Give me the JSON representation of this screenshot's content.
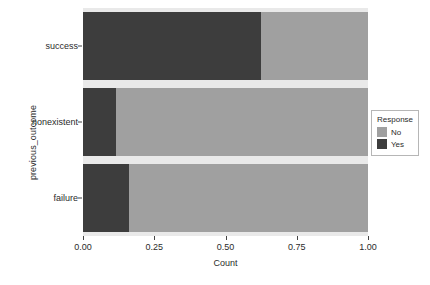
{
  "chart_data": {
    "type": "bar",
    "orientation": "horizontal",
    "stacked": true,
    "normalized": true,
    "title": "",
    "xlabel": "Count",
    "ylabel": "previous_outcome",
    "categories": [
      "failure",
      "nonexistent",
      "success"
    ],
    "category_order_top_to_bottom": [
      "success",
      "nonexistent",
      "failure"
    ],
    "series": [
      {
        "name": "Yes",
        "color": "#3d3d3d",
        "values": [
          0.16,
          0.115,
          0.625
        ]
      },
      {
        "name": "No",
        "color": "#a0a0a0",
        "values": [
          0.84,
          0.885,
          0.375
        ]
      }
    ],
    "xlim": [
      0.0,
      1.0
    ],
    "xticks": [
      0.0,
      0.25,
      0.5,
      0.75,
      1.0
    ],
    "xtick_labels": [
      "0.00",
      "0.25",
      "0.50",
      "0.75",
      "1.00"
    ],
    "grid": false,
    "legend": {
      "title": "Response",
      "position": "right",
      "entries": [
        "No",
        "Yes"
      ]
    },
    "panel_background": "#e9e9e9",
    "plot_background": "#ffffff"
  },
  "axes": {
    "x_title": "Count",
    "y_title": "previous_outcome",
    "x_ticks": [
      {
        "value": 0.0,
        "label": "0.00"
      },
      {
        "value": 0.25,
        "label": "0.25"
      },
      {
        "value": 0.5,
        "label": "0.50"
      },
      {
        "value": 0.75,
        "label": "0.75"
      },
      {
        "value": 1.0,
        "label": "1.00"
      }
    ],
    "y_ticks": [
      {
        "label": "success"
      },
      {
        "label": "nonexistent"
      },
      {
        "label": "failure"
      }
    ]
  },
  "legend": {
    "title": "Response",
    "items": [
      {
        "label": "No",
        "color": "#a0a0a0"
      },
      {
        "label": "Yes",
        "color": "#3d3d3d"
      }
    ]
  }
}
